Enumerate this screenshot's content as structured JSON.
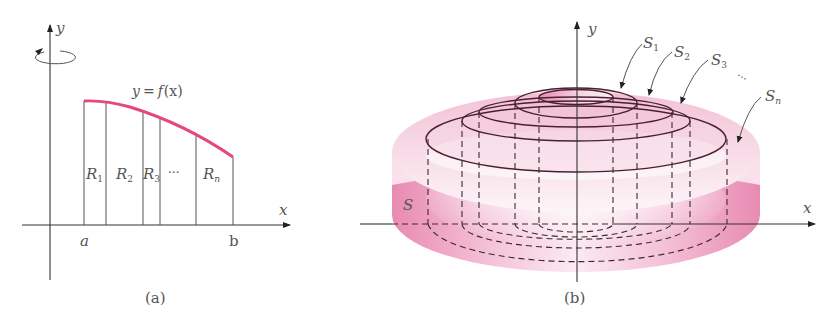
{
  "figure_a": {
    "caption": "(a)",
    "axis_x_label": "x",
    "axis_y_label": "y",
    "curve_label": "y = f(x)",
    "curve_label_parts": {
      "lhs": "y",
      "eq": "=",
      "fn": "f",
      "arg": "(x)"
    },
    "left_bound": "a",
    "right_bound": "b",
    "regions": [
      {
        "label": "R",
        "sub": "1"
      },
      {
        "label": "R",
        "sub": "2"
      },
      {
        "label": "R",
        "sub": "3"
      },
      {
        "label": "···",
        "sub": ""
      },
      {
        "label": "R",
        "sub": "n"
      }
    ],
    "rotation_icon": "rotation-arrow-icon",
    "curve_color": "#e5477f"
  },
  "figure_b": {
    "caption": "(b)",
    "axis_x_label": "x",
    "axis_y_label": "y",
    "solid_label": "S",
    "shells": [
      {
        "label": "S",
        "sub": "1"
      },
      {
        "label": "S",
        "sub": "2"
      },
      {
        "label": "S",
        "sub": "3"
      },
      {
        "label": "···",
        "sub": ""
      },
      {
        "label": "S",
        "sub": "n"
      }
    ],
    "solid_color": "#e880ab"
  }
}
